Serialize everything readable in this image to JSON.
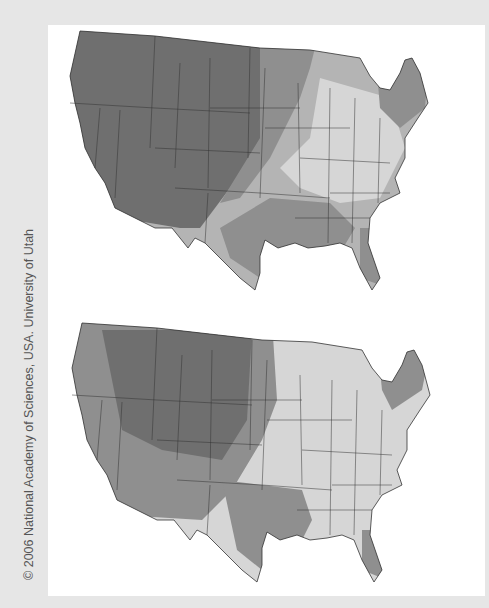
{
  "credit": "© 2006 National Academy of Sciences, USA. University of Utah",
  "maps": [
    {
      "name": "upper-map",
      "description": "Contiguous United States shaded map (top)"
    },
    {
      "name": "lower-map",
      "description": "Contiguous United States shaded map (bottom)"
    }
  ],
  "colors": {
    "dark": "#6f6f6f",
    "mid": "#8f8f8f",
    "light": "#b4b4b4",
    "pale": "#d6d6d6",
    "border": "#333333",
    "background": "#e6e6e6",
    "panel": "#ffffff"
  }
}
